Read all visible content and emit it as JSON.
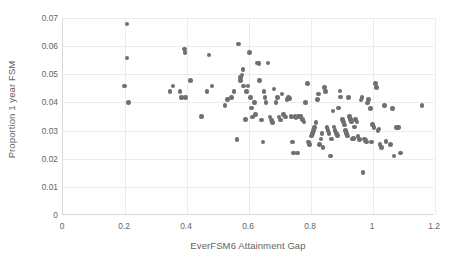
{
  "chart_data": {
    "type": "scatter",
    "title": "",
    "xlabel": "EverFSM6 Attainment Gap",
    "ylabel": "Proportion 1 year FSM",
    "xlim": [
      0,
      1.2
    ],
    "ylim": [
      0,
      0.07
    ],
    "xticks": [
      "0",
      "0.2",
      "0.4",
      "0.6",
      "0.8",
      "1",
      "1.2"
    ],
    "xtick_values": [
      0,
      0.2,
      0.4,
      0.6,
      0.8,
      1.0,
      1.2
    ],
    "yticks": [
      "0",
      "0.01",
      "0.02",
      "0.03",
      "0.04",
      "0.05",
      "0.06",
      "0.07"
    ],
    "ytick_values": [
      0,
      0.01,
      0.02,
      0.03,
      0.04,
      0.05,
      0.06,
      0.07
    ],
    "grid": true,
    "legend": false,
    "marker_color": "#6f6f6f",
    "series": [
      {
        "name": "schools",
        "points": [
          [
            0.199,
            0.0458
          ],
          [
            0.206,
            0.0678
          ],
          [
            0.207,
            0.0558
          ],
          [
            0.212,
            0.0399
          ],
          [
            0.345,
            0.0438
          ],
          [
            0.355,
            0.0458
          ],
          [
            0.378,
            0.0438
          ],
          [
            0.382,
            0.0418
          ],
          [
            0.392,
            0.059
          ],
          [
            0.393,
            0.0578
          ],
          [
            0.395,
            0.0418
          ],
          [
            0.412,
            0.0478
          ],
          [
            0.447,
            0.035
          ],
          [
            0.464,
            0.0438
          ],
          [
            0.471,
            0.0568
          ],
          [
            0.481,
            0.0458
          ],
          [
            0.522,
            0.0389
          ],
          [
            0.531,
            0.041
          ],
          [
            0.543,
            0.0418
          ],
          [
            0.552,
            0.0438
          ],
          [
            0.561,
            0.0269
          ],
          [
            0.566,
            0.0608
          ],
          [
            0.572,
            0.0488
          ],
          [
            0.573,
            0.0478
          ],
          [
            0.578,
            0.0498
          ],
          [
            0.58,
            0.0518
          ],
          [
            0.583,
            0.0458
          ],
          [
            0.589,
            0.034
          ],
          [
            0.592,
            0.0438
          ],
          [
            0.597,
            0.0458
          ],
          [
            0.601,
            0.0578
          ],
          [
            0.604,
            0.0418
          ],
          [
            0.608,
            0.038
          ],
          [
            0.612,
            0.0348
          ],
          [
            0.617,
            0.0399
          ],
          [
            0.621,
            0.0358
          ],
          [
            0.628,
            0.054
          ],
          [
            0.632,
            0.0538
          ],
          [
            0.634,
            0.0478
          ],
          [
            0.641,
            0.0338
          ],
          [
            0.645,
            0.026
          ],
          [
            0.648,
            0.0438
          ],
          [
            0.652,
            0.0418
          ],
          [
            0.655,
            0.0399
          ],
          [
            0.661,
            0.054
          ],
          [
            0.668,
            0.0348
          ],
          [
            0.672,
            0.0338
          ],
          [
            0.675,
            0.0328
          ],
          [
            0.681,
            0.0448
          ],
          [
            0.687,
            0.0399
          ],
          [
            0.692,
            0.0418
          ],
          [
            0.697,
            0.0348
          ],
          [
            0.702,
            0.0338
          ],
          [
            0.706,
            0.043
          ],
          [
            0.712,
            0.0358
          ],
          [
            0.718,
            0.0348
          ],
          [
            0.723,
            0.041
          ],
          [
            0.727,
            0.0418
          ],
          [
            0.731,
            0.0413
          ],
          [
            0.735,
            0.035
          ],
          [
            0.739,
            0.0348
          ],
          [
            0.741,
            0.026
          ],
          [
            0.744,
            0.022
          ],
          [
            0.748,
            0.035
          ],
          [
            0.752,
            0.0345
          ],
          [
            0.756,
            0.022
          ],
          [
            0.759,
            0.0352
          ],
          [
            0.763,
            0.0348
          ],
          [
            0.768,
            0.035
          ],
          [
            0.772,
            0.034
          ],
          [
            0.778,
            0.033
          ],
          [
            0.783,
            0.0399
          ],
          [
            0.788,
            0.0468
          ],
          [
            0.792,
            0.026
          ],
          [
            0.796,
            0.025
          ],
          [
            0.801,
            0.028
          ],
          [
            0.805,
            0.029
          ],
          [
            0.808,
            0.03
          ],
          [
            0.812,
            0.031
          ],
          [
            0.816,
            0.0328
          ],
          [
            0.821,
            0.041
          ],
          [
            0.824,
            0.043
          ],
          [
            0.828,
            0.025
          ],
          [
            0.832,
            0.027
          ],
          [
            0.836,
            0.029
          ],
          [
            0.839,
            0.024
          ],
          [
            0.843,
            0.0452
          ],
          [
            0.847,
            0.0438
          ],
          [
            0.851,
            0.031
          ],
          [
            0.855,
            0.03
          ],
          [
            0.858,
            0.029
          ],
          [
            0.862,
            0.021
          ],
          [
            0.866,
            0.027
          ],
          [
            0.871,
            0.037
          ],
          [
            0.874,
            0.0312
          ],
          [
            0.878,
            0.03
          ],
          [
            0.882,
            0.029
          ],
          [
            0.886,
            0.0282
          ],
          [
            0.889,
            0.038
          ],
          [
            0.893,
            0.044
          ],
          [
            0.896,
            0.042
          ],
          [
            0.901,
            0.034
          ],
          [
            0.905,
            0.033
          ],
          [
            0.908,
            0.032
          ],
          [
            0.912,
            0.03
          ],
          [
            0.915,
            0.029
          ],
          [
            0.918,
            0.028
          ],
          [
            0.921,
            0.0418
          ],
          [
            0.925,
            0.035
          ],
          [
            0.928,
            0.034
          ],
          [
            0.931,
            0.033
          ],
          [
            0.934,
            0.027
          ],
          [
            0.938,
            0.0272
          ],
          [
            0.941,
            0.0312
          ],
          [
            0.944,
            0.034
          ],
          [
            0.948,
            0.033
          ],
          [
            0.952,
            0.0278
          ],
          [
            0.956,
            0.0268
          ],
          [
            0.961,
            0.0408
          ],
          [
            0.965,
            0.0418
          ],
          [
            0.968,
            0.015
          ],
          [
            0.972,
            0.027
          ],
          [
            0.976,
            0.0265
          ],
          [
            0.979,
            0.026
          ],
          [
            0.983,
            0.0398
          ],
          [
            0.986,
            0.041
          ],
          [
            0.991,
            0.0378
          ],
          [
            0.995,
            0.026
          ],
          [
            0.999,
            0.0322
          ],
          [
            1.003,
            0.031
          ],
          [
            1.008,
            0.0468
          ],
          [
            1.012,
            0.0452
          ],
          [
            1.016,
            0.03
          ],
          [
            1.019,
            0.0305
          ],
          [
            1.023,
            0.025
          ],
          [
            1.027,
            0.024
          ],
          [
            1.038,
            0.0389
          ],
          [
            1.042,
            0.0262
          ],
          [
            1.056,
            0.025
          ],
          [
            1.062,
            0.0378
          ],
          [
            1.068,
            0.021
          ],
          [
            1.075,
            0.031
          ],
          [
            1.082,
            0.031
          ],
          [
            1.088,
            0.022
          ],
          [
            1.158,
            0.0389
          ]
        ]
      }
    ]
  }
}
